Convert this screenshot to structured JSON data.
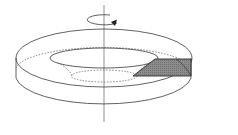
{
  "diagram": {
    "description": "Solid of revolution: ring-shaped disk with a conical inner opening rotated about a vertical axis; shaded cross-section shown",
    "colors": {
      "line": "#3a3a3a",
      "section_fill": "#8c8c8c",
      "background": "#ffffff"
    },
    "elements": {
      "axis": "vertical rotation axis",
      "rotation_arrow": "rotation-arrow",
      "section": "shaded cross-section"
    }
  }
}
